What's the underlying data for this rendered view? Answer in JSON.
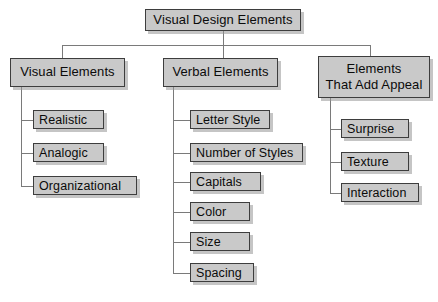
{
  "diagram": {
    "title": "Visual Design Elements",
    "type": "hierarchy-tree",
    "root": {
      "label": "Visual Design Elements",
      "x": 145,
      "y": 9,
      "w": 156,
      "h": 22
    },
    "branches": [
      {
        "name": "visual-elements",
        "label": "Visual Elements",
        "x": 10,
        "y": 58,
        "w": 115,
        "h": 29,
        "spine_x": 21,
        "leaves": [
          {
            "label": "Realistic",
            "x": 33,
            "y": 110,
            "w": 71,
            "h": 19
          },
          {
            "label": "Analogic",
            "x": 33,
            "y": 143,
            "w": 71,
            "h": 19
          },
          {
            "label": "Organizational",
            "x": 33,
            "y": 176,
            "w": 104,
            "h": 19
          }
        ]
      },
      {
        "name": "verbal-elements",
        "label": "Verbal Elements",
        "x": 163,
        "y": 58,
        "w": 115,
        "h": 29,
        "spine_x": 173,
        "leaves": [
          {
            "label": "Letter Style",
            "x": 190,
            "y": 110,
            "w": 80,
            "h": 19
          },
          {
            "label": "Number of Styles",
            "x": 190,
            "y": 143,
            "w": 113,
            "h": 19
          },
          {
            "label": "Capitals",
            "x": 190,
            "y": 172,
            "w": 71,
            "h": 19
          },
          {
            "label": "Color",
            "x": 190,
            "y": 202,
            "w": 60,
            "h": 19
          },
          {
            "label": "Size",
            "x": 190,
            "y": 232,
            "w": 60,
            "h": 19
          },
          {
            "label": "Spacing",
            "x": 190,
            "y": 263,
            "w": 64,
            "h": 19
          }
        ]
      },
      {
        "name": "elements-that-add-appeal",
        "label": "Elements\nThat Add Appeal",
        "x": 318,
        "y": 56,
        "w": 112,
        "h": 42,
        "spine_x": 330,
        "leaves": [
          {
            "label": "Surprise",
            "x": 341,
            "y": 119,
            "w": 68,
            "h": 19
          },
          {
            "label": "Texture",
            "x": 341,
            "y": 152,
            "w": 68,
            "h": 19
          },
          {
            "label": "Interaction",
            "x": 341,
            "y": 183,
            "w": 78,
            "h": 19
          }
        ]
      }
    ],
    "connectors": {
      "root_stem_x": 223,
      "root_stem_top": 31,
      "bus_y": 45,
      "bus_left": 62,
      "bus_right": 370,
      "drop_bottom": 58
    },
    "colors": {
      "box_fill": "#c9c9c9",
      "box_border": "#3d3d3d",
      "line": "#7a7a7a",
      "text": "#0b0b0b",
      "background": "#ffffff",
      "shadow": "#969696"
    }
  }
}
